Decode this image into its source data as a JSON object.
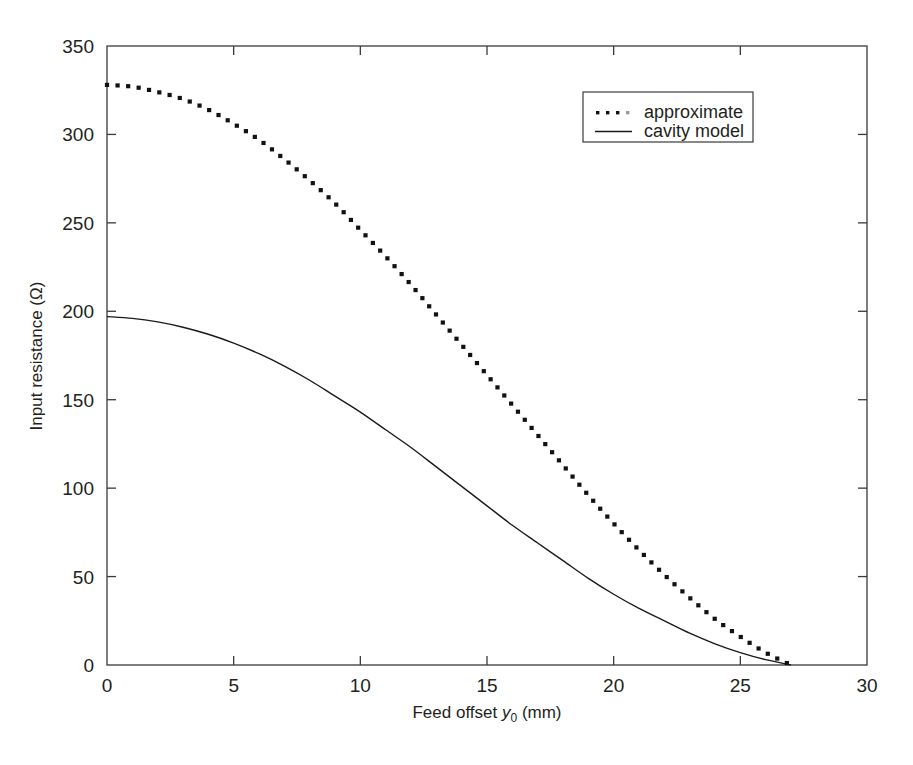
{
  "chart_data": {
    "type": "line",
    "title": "",
    "xlabel": "Feed offset y₀ (mm)",
    "xlabel_main": "Feed offset",
    "xlabel_var": "y",
    "xlabel_sub": "0",
    "xlabel_unit": "(mm)",
    "ylabel": "Input resistance (Ω)",
    "xlim": [
      0,
      30
    ],
    "ylim": [
      0,
      350
    ],
    "xticks": [
      0,
      5,
      10,
      15,
      20,
      25,
      30
    ],
    "xtick_labels": [
      "0",
      "5",
      "10",
      "15",
      "20",
      "25",
      "30"
    ],
    "yticks": [
      0,
      50,
      100,
      150,
      200,
      250,
      300,
      350
    ],
    "ytick_labels": [
      "0",
      "50",
      "100",
      "150",
      "200",
      "250",
      "300",
      "350"
    ],
    "grid": false,
    "legend_position": "top-right",
    "legend_entries": [
      {
        "label": "approximate",
        "style": "dotted"
      },
      {
        "label": "cavity model",
        "style": "solid"
      }
    ],
    "series": [
      {
        "name": "approximate",
        "style": "dotted",
        "x": [
          0,
          1,
          2,
          3,
          4,
          5,
          6,
          7,
          8,
          9,
          10,
          11,
          12,
          13,
          14,
          15,
          16,
          17,
          18,
          19,
          20,
          21,
          22,
          23,
          24,
          25,
          26,
          27
        ],
        "values": [
          328,
          327,
          324,
          320,
          314,
          306,
          297,
          286,
          274,
          261,
          246,
          231,
          215,
          198,
          181,
          164,
          147,
          130,
          113,
          96,
          80,
          65,
          51,
          38,
          26,
          16,
          7,
          0
        ]
      },
      {
        "name": "cavity model",
        "style": "solid",
        "x": [
          0,
          1,
          2,
          3,
          4,
          5,
          6,
          7,
          8,
          9,
          10,
          11,
          12,
          13,
          14,
          15,
          16,
          17,
          18,
          19,
          20,
          21,
          22,
          23,
          24,
          25,
          26,
          27
        ],
        "values": [
          197,
          196,
          194,
          191,
          187,
          182,
          176,
          169,
          161,
          152,
          143,
          133,
          123,
          112,
          101,
          90,
          79,
          69,
          59,
          49,
          40,
          32,
          25,
          18,
          12,
          7,
          3,
          0
        ]
      }
    ]
  }
}
